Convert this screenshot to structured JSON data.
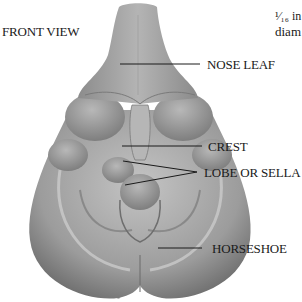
{
  "title": "FRONT VIEW",
  "labels": {
    "nose_leaf": "NOSE LEAF",
    "crest": "CREST",
    "lobe": "LOBE OR SELLA",
    "horseshoe": "HORSESHOE"
  },
  "corner_text": {
    "line1": "¹⁄₁₆ in",
    "line2": "diam"
  },
  "colors": {
    "background": "#ffffff",
    "structure": "#9a9a9a",
    "text": "#1a1a1a"
  }
}
